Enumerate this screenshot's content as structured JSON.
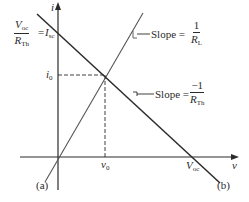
{
  "diagram": {
    "axes": {
      "y_label": "i",
      "x_label": "v"
    },
    "left_annotation": {
      "numerator_main": "V",
      "numerator_sub": "oc",
      "denominator_main": "R",
      "denominator_sub": "Th",
      "equals": "=",
      "rhs_main": "I",
      "rhs_sub": "sc"
    },
    "i0_label": {
      "main": "i",
      "sub": "0"
    },
    "v0_label": {
      "main": "v",
      "sub": "0"
    },
    "voc_label": {
      "main": "V",
      "sub": "oc"
    },
    "slope_load": {
      "text": "Slope =",
      "numerator": "1",
      "denominator_main": "R",
      "denominator_sub": "L"
    },
    "slope_thevenin": {
      "text": "Slope =",
      "numerator": "−1",
      "denominator_main": "R",
      "denominator_sub": "Th"
    },
    "curve_a_label": "(a)",
    "curve_b_label": "(b)",
    "colors": {
      "lines": "#2b2b2b",
      "load_line": "#555555"
    }
  }
}
